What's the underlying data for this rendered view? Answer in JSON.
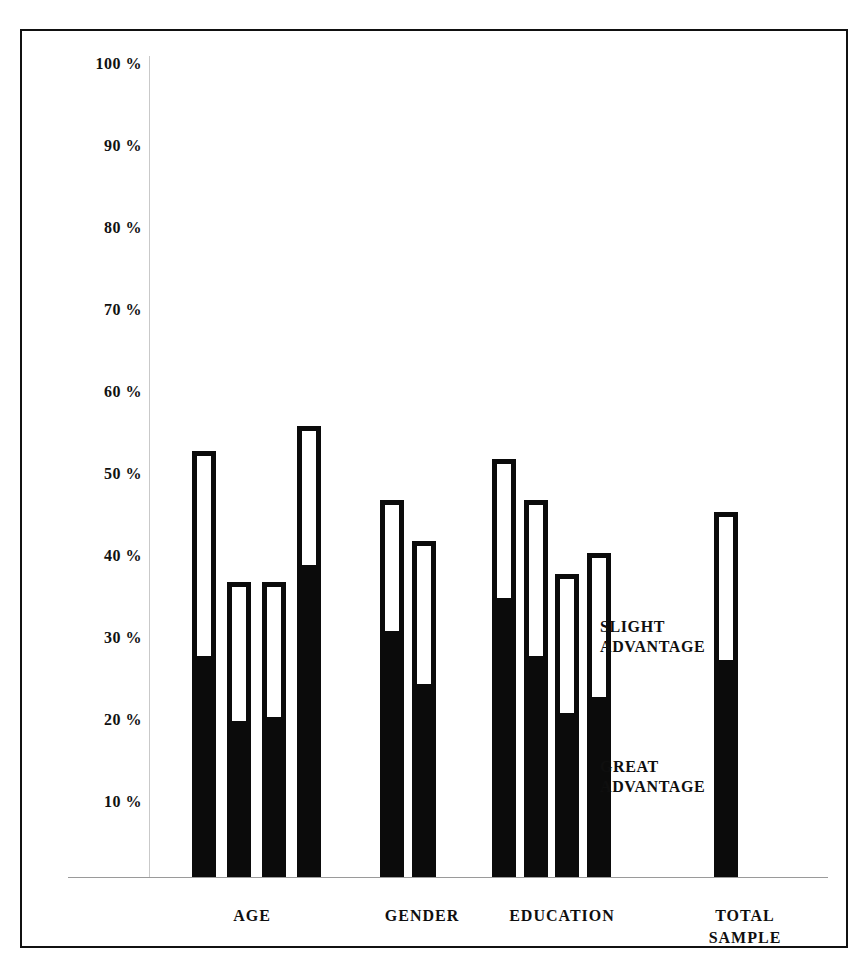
{
  "chart_data": {
    "type": "bar",
    "title": "",
    "subtitle": "",
    "xlabel": "",
    "ylabel": "",
    "ylim": [
      0,
      100
    ],
    "grid": false,
    "legend_position": "inside-right",
    "stacked": true,
    "y_ticks": [
      "100 %",
      "90 %",
      "80 %",
      "70 %",
      "60 %",
      "50 %",
      "40 %",
      "30 %",
      "20 %",
      "10 %"
    ],
    "y_tick_values": [
      100,
      90,
      80,
      70,
      60,
      50,
      40,
      30,
      20,
      10
    ],
    "series": [
      {
        "name": "GREAT ADVANTAGE",
        "color": "#0b0b0b",
        "values": [
          27,
          19,
          19.5,
          38,
          30,
          23.5,
          34,
          27,
          20,
          22,
          26.5
        ]
      },
      {
        "name": "SLIGHT ADVANTAGE",
        "color": "#ffffff",
        "values": [
          25,
          17,
          16.5,
          17,
          16,
          17.5,
          17,
          19,
          17,
          17.5,
          18
        ]
      }
    ],
    "totals": [
      52,
      36,
      36,
      55,
      46,
      41,
      51,
      46,
      37,
      39.5,
      44.5
    ],
    "groups": [
      {
        "label": "AGE",
        "bar_count": 4
      },
      {
        "label": "GENDER",
        "bar_count": 2
      },
      {
        "label": "EDUCATION",
        "bar_count": 4
      },
      {
        "label": "TOTAL\nSAMPLE",
        "bar_count": 1
      }
    ],
    "legend_entries": [
      {
        "label": "SLIGHT\nADVANTAGE"
      },
      {
        "label": "GREAT\nADVANTAGE"
      }
    ]
  },
  "axis": {
    "tick_0": "100 %",
    "tick_1": "90 %",
    "tick_2": "80 %",
    "tick_3": "70 %",
    "tick_4": "60 %",
    "tick_5": "50 %",
    "tick_6": "40 %",
    "tick_7": "30 %",
    "tick_8": "20 %",
    "tick_9": "10 %"
  },
  "groups": {
    "age": "AGE",
    "gender": "GENDER",
    "education": "EDUCATION",
    "total_sample": "TOTAL\nSAMPLE"
  },
  "legend": {
    "slight": "SLIGHT\nADVANTAGE",
    "great": "GREAT\nADVANTAGE"
  },
  "colors": {
    "bar_fill_great": "#0b0b0b",
    "bar_fill_slight": "#ffffff",
    "frame": "#111111",
    "axis": "#9a9a9a"
  }
}
